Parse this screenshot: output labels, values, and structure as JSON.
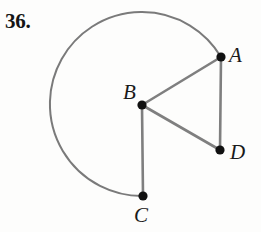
{
  "figure": {
    "problem_number": "36.",
    "colors": {
      "arc_stroke": "#7a7a7a",
      "segment_stroke": "#7f7f7f",
      "point_fill": "#111111",
      "label_color": "#1a1a1a",
      "number_color": "#151515",
      "background": "#fdfdfc"
    },
    "stroke_widths": {
      "arc": 2.0,
      "segment": 2.6,
      "point_radius": 4.6
    },
    "points": [
      {
        "name": "A",
        "label": "A",
        "cx": 221,
        "cy": 57,
        "label_x": 229,
        "label_y": 45
      },
      {
        "name": "B",
        "label": "B",
        "cx": 142,
        "cy": 105,
        "label_x": 123,
        "label_y": 82
      },
      {
        "name": "C",
        "label": "C",
        "cx": 143,
        "cy": 196,
        "label_x": 134,
        "label_y": 205
      },
      {
        "name": "D",
        "label": "D",
        "cx": 220,
        "cy": 150,
        "label_x": 230,
        "label_y": 142
      }
    ],
    "circle": {
      "center": "B",
      "center_x": 142,
      "center_y": 105,
      "radius": 92
    },
    "arc": {
      "from": "A",
      "to": "C",
      "type": "major",
      "direction": "counterclockwise",
      "path": "M 221 57 A 92 92 0 1 0 143 196"
    },
    "segments": [
      {
        "name": "BA",
        "from": "B",
        "to": "A",
        "x1": 142,
        "y1": 105,
        "x2": 221,
        "y2": 57
      },
      {
        "name": "AD",
        "from": "A",
        "to": "D",
        "x1": 221,
        "y1": 57,
        "x2": 220,
        "y2": 150
      },
      {
        "name": "DB",
        "from": "D",
        "to": "B",
        "x1": 220,
        "y1": 150,
        "x2": 142,
        "y2": 105
      },
      {
        "name": "BC",
        "from": "B",
        "to": "C",
        "x1": 142,
        "y1": 105,
        "x2": 143,
        "y2": 196
      }
    ]
  }
}
